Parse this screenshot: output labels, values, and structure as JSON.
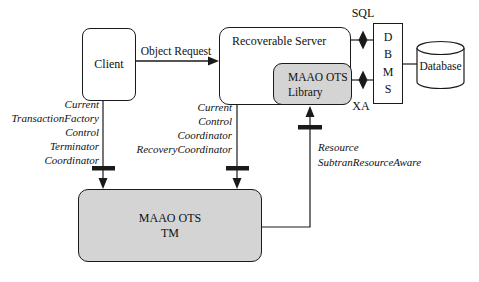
{
  "diagram": {
    "background": "#ffffff",
    "line_color": "#1a1a1a",
    "gray_fill": "#d4d4d4",
    "white_fill": "#ffffff"
  },
  "nodes": {
    "client": {
      "label": "Client"
    },
    "recoverable_server": {
      "label": "Recoverable Server"
    },
    "maao_ots_library": {
      "line1": "MAAO OTS",
      "line2": "Library"
    },
    "dbms": {
      "letters": [
        "D",
        "B",
        "M",
        "S"
      ]
    },
    "database": {
      "label": "Database"
    },
    "maao_ots_tm": {
      "line1": "MAAO OTS",
      "line2": "TM"
    }
  },
  "edges": {
    "object_request": {
      "label": "Object Request"
    },
    "sql": {
      "label": "SQL"
    },
    "xa": {
      "label": "XA"
    }
  },
  "interfaces": {
    "client_to_tm": [
      "Current",
      "TransactionFactory",
      "Control",
      "Terminator",
      "Coordinator"
    ],
    "server_to_tm": [
      "Current",
      "Control",
      "Coordinator",
      "RecoveryCoordinator"
    ],
    "tm_to_library": [
      "Resource",
      "SubtranResourceAware"
    ]
  }
}
